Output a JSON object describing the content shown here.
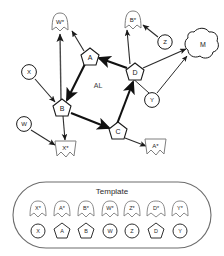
{
  "diagram": {
    "area_label": "AL",
    "nodes": [
      {
        "id": "Wstar",
        "label": "W*",
        "shape": "banner",
        "x": 60,
        "y": 22
      },
      {
        "id": "Bstar",
        "label": "B*",
        "shape": "banner",
        "x": 133,
        "y": 20
      },
      {
        "id": "Z",
        "label": "Z",
        "shape": "circle",
        "x": 165,
        "y": 42
      },
      {
        "id": "M",
        "label": "M",
        "shape": "cloud",
        "x": 202,
        "y": 45
      },
      {
        "id": "A",
        "label": "A",
        "shape": "pentagon",
        "x": 90,
        "y": 57
      },
      {
        "id": "D",
        "label": "D",
        "shape": "pentagon",
        "x": 135,
        "y": 72
      },
      {
        "id": "X",
        "label": "X",
        "shape": "circle",
        "x": 29,
        "y": 72
      },
      {
        "id": "Y",
        "label": "Y",
        "shape": "circle",
        "x": 152,
        "y": 100
      },
      {
        "id": "B",
        "label": "B",
        "shape": "pentagon",
        "x": 62,
        "y": 108
      },
      {
        "id": "W",
        "label": "W",
        "shape": "circle",
        "x": 24,
        "y": 124
      },
      {
        "id": "C",
        "label": "C",
        "shape": "pentagon",
        "x": 118,
        "y": 131
      },
      {
        "id": "Xstar",
        "label": "X*",
        "shape": "banner",
        "x": 65,
        "y": 148
      },
      {
        "id": "Astar",
        "label": "A*",
        "shape": "banner",
        "x": 155,
        "y": 146
      }
    ],
    "edges": [
      {
        "from": "B",
        "to": "Wstar",
        "weight": "thin"
      },
      {
        "from": "A",
        "to": "Wstar",
        "weight": "thin"
      },
      {
        "from": "D",
        "to": "Bstar",
        "weight": "thin"
      },
      {
        "from": "Z",
        "to": "Bstar",
        "weight": "thin"
      },
      {
        "from": "D",
        "to": "A",
        "weight": "thick"
      },
      {
        "from": "A",
        "to": "B",
        "weight": "thick"
      },
      {
        "from": "B",
        "to": "C",
        "weight": "thick"
      },
      {
        "from": "C",
        "to": "D",
        "weight": "thick"
      },
      {
        "from": "D",
        "to": "M",
        "weight": "thin"
      },
      {
        "from": "Y",
        "to": "M",
        "weight": "thin"
      },
      {
        "from": "Y",
        "to": "C",
        "weight": "thin"
      },
      {
        "from": "X",
        "to": "B",
        "weight": "thin"
      },
      {
        "from": "W",
        "to": "Xstar",
        "weight": "thin"
      },
      {
        "from": "B",
        "to": "Xstar",
        "weight": "thin"
      },
      {
        "from": "C",
        "to": "Astar",
        "weight": "thin"
      }
    ]
  },
  "template": {
    "title": "Template",
    "items": [
      {
        "top_label": "X*",
        "top_shape": "banner",
        "bottom_label": "X",
        "bottom_shape": "circle"
      },
      {
        "top_label": "A*",
        "top_shape": "banner",
        "bottom_label": "A",
        "bottom_shape": "pentagon"
      },
      {
        "top_label": "B*",
        "top_shape": "banner",
        "bottom_label": "B",
        "bottom_shape": "pentagon"
      },
      {
        "top_label": "W*",
        "top_shape": "banner",
        "bottom_label": "W",
        "bottom_shape": "circle"
      },
      {
        "top_label": "Z*",
        "top_shape": "banner",
        "bottom_label": "Z",
        "bottom_shape": "circle"
      },
      {
        "top_label": "D*",
        "top_shape": "banner",
        "bottom_label": "D",
        "bottom_shape": "pentagon"
      },
      {
        "top_label": "Y*",
        "top_shape": "banner",
        "bottom_label": "Y",
        "bottom_shape": "circle"
      }
    ]
  },
  "colors": {
    "stroke_dark": "#1a1a1a",
    "stroke_gray": "#8a8a8a",
    "stroke_mid": "#555555",
    "background": "#ffffff",
    "text": "#1a1a1a"
  }
}
